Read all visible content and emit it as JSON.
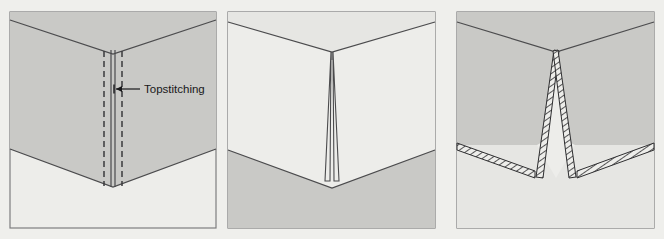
{
  "figure": {
    "background_color": "#efefec",
    "width": 664,
    "height": 239,
    "panel_count": 3
  },
  "palette": {
    "page_background": "#efefec",
    "panel_fill_light": "#ededea",
    "fabric_gray": "#c9c9c6",
    "fabric_light": "#e6e6e3",
    "outline": "#4b4b4d",
    "hatch_stroke": "#2e2e30",
    "stitch_color": "#3a3a3c",
    "label_color": "#18181a",
    "panel_border": "#7d7d7f"
  },
  "panels": [
    {
      "id": "panel-1",
      "name": "topstitched-pleat",
      "order": 1,
      "x": 8,
      "width": 210,
      "background": "#ededea",
      "top_shape_fill": "#c9c9c6",
      "bottom_shape_fill": "#c9c9c6",
      "annotation": {
        "label": "Topstitching",
        "arrow_direction": "left",
        "label_x": 146,
        "label_y": 104,
        "arrow_tip_x": 114,
        "arrow_tip_y": 101,
        "arrow_tail_x": 140,
        "arrow_tail_y": 101
      },
      "seam": {
        "type": "vertical-center-seam",
        "center_x": 113,
        "top_y": 62,
        "bottom_y": 195,
        "stitch_lines": 2,
        "stitch_style": "dashed",
        "stitch_offset": 7
      }
    },
    {
      "id": "panel-2",
      "name": "open-wedge-pleat",
      "order": 2,
      "x": 226,
      "width": 211,
      "background": "#ededea",
      "top_shape_fill": "#e6e6e3",
      "bottom_shape_fill": "#c9c9c6",
      "wedge": {
        "type": "v-slit",
        "apex_x": 340,
        "apex_y": 62,
        "base_left_x": 332,
        "base_right_x": 348,
        "base_y": 192
      }
    },
    {
      "id": "panel-3",
      "name": "serged-seam-allowance",
      "order": 3,
      "x": 455,
      "width": 201,
      "background": "#ededea",
      "top_shape_fill": "#c9c9c6",
      "bottom_shape_fill": "#e6e6e3",
      "hatching": {
        "style": "diagonal-hatch-band",
        "band_width": 7,
        "description": "serged seam allowance edges"
      },
      "wedge": {
        "apex_x": 557,
        "apex_y": 62,
        "base_left_x": 536,
        "base_right_x": 578,
        "base_y": 190
      }
    }
  ],
  "geometry": {
    "chevron_top_side_y": 28,
    "chevron_top_apex_y": 62,
    "chevron_bottom_side_y": 157,
    "chevron_bottom_apex_y": 195,
    "panel_inset_top": 12,
    "panel_inset_bottom": 228
  }
}
